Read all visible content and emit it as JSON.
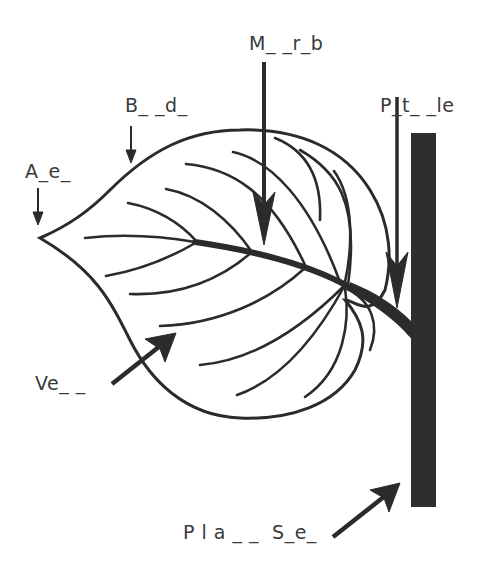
{
  "diagram": {
    "colors": {
      "ink": "#2b2b2b",
      "stem": "#2e2e2e",
      "label_text": "#3a3a3a",
      "background": "#ffffff"
    },
    "labels": {
      "midrib": "M_ _r_b",
      "blade": "B_ _d_",
      "apex": "A_e_",
      "petiole": "P_t_ _le",
      "vein": "Ve_ _",
      "plant_stem": "P l a _ _  S_e_"
    },
    "parts": [
      {
        "id": "apex",
        "answer_hint": "A_e_"
      },
      {
        "id": "blade",
        "answer_hint": "B_ _d_"
      },
      {
        "id": "midrib",
        "answer_hint": "M_ _r_b"
      },
      {
        "id": "petiole",
        "answer_hint": "P_t_ _le"
      },
      {
        "id": "vein",
        "answer_hint": "Ve_ _"
      },
      {
        "id": "plant-stem",
        "answer_hint": "P l a _ _  S_e_"
      }
    ]
  }
}
